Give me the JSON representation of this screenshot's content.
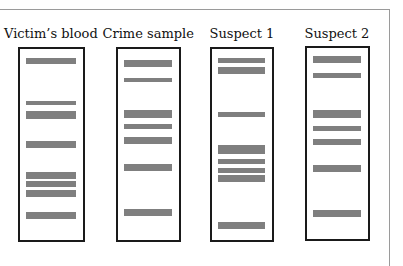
{
  "figure": {
    "title": "",
    "band_color": "#7f7f7f",
    "lane_border_color": "#1a1a1a",
    "lanes": [
      {
        "label": "Victim's blood",
        "box": {
          "x": 18,
          "y": 47,
          "w": 67,
          "h": 195
        },
        "label_x": 51,
        "bands": [
          {
            "y": 58,
            "h": 6
          },
          {
            "y": 101,
            "h": 4
          },
          {
            "y": 111,
            "h": 8
          },
          {
            "y": 141,
            "h": 7
          },
          {
            "y": 172,
            "h": 7
          },
          {
            "y": 181,
            "h": 6
          },
          {
            "y": 190,
            "h": 7
          },
          {
            "y": 212,
            "h": 7
          }
        ]
      },
      {
        "label": "Crime sample",
        "box": {
          "x": 116,
          "y": 47,
          "w": 65,
          "h": 195
        },
        "label_x": 148,
        "bands": [
          {
            "y": 60,
            "h": 7
          },
          {
            "y": 78,
            "h": 4
          },
          {
            "y": 110,
            "h": 8
          },
          {
            "y": 124,
            "h": 5
          },
          {
            "y": 137,
            "h": 7
          },
          {
            "y": 164,
            "h": 7
          },
          {
            "y": 209,
            "h": 7
          }
        ]
      },
      {
        "label": "Suspect 1",
        "box": {
          "x": 210,
          "y": 47,
          "w": 64,
          "h": 195
        },
        "label_x": 242,
        "bands": [
          {
            "y": 58,
            "h": 5
          },
          {
            "y": 67,
            "h": 7
          },
          {
            "y": 112,
            "h": 5
          },
          {
            "y": 145,
            "h": 9
          },
          {
            "y": 159,
            "h": 5
          },
          {
            "y": 168,
            "h": 5
          },
          {
            "y": 175,
            "h": 7
          },
          {
            "y": 222,
            "h": 7
          }
        ]
      },
      {
        "label": "Suspect 2",
        "box": {
          "x": 305,
          "y": 46,
          "w": 65,
          "h": 195
        },
        "label_x": 337,
        "bands": [
          {
            "y": 56,
            "h": 7
          },
          {
            "y": 73,
            "h": 5
          },
          {
            "y": 110,
            "h": 8
          },
          {
            "y": 126,
            "h": 5
          },
          {
            "y": 139,
            "h": 6
          },
          {
            "y": 165,
            "h": 7
          },
          {
            "y": 210,
            "h": 7
          }
        ]
      }
    ]
  }
}
